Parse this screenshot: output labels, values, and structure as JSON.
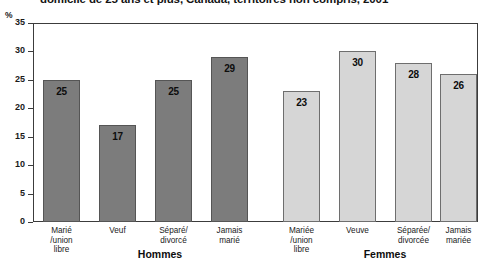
{
  "chart_data": {
    "type": "bar",
    "title": "domicile de 25 ans et plus, Canada, territoires non compris, 2001",
    "xlabel": "",
    "ylabel": "%",
    "ylim": [
      0,
      35
    ],
    "yticks": [
      "0",
      "5",
      "10",
      "15",
      "20",
      "25",
      "30",
      "35"
    ],
    "grid": false,
    "legend": "none",
    "groups": [
      {
        "name": "Hommes",
        "color": "#7c7c7c",
        "categories": [
          "Marié\n/union\nlibre",
          "Veuf",
          "Séparé/\ndivorcé",
          "Jamais\nmarié"
        ],
        "values": [
          25,
          17,
          25,
          29
        ]
      },
      {
        "name": "Femmes",
        "color": "#d6d6d6",
        "categories": [
          "Mariée\n/union\nlibre",
          "Veuve",
          "Séparée/\ndivorcée",
          "Jamais\nmariée"
        ],
        "values": [
          23,
          30,
          28,
          26
        ]
      }
    ],
    "categories": [
      "Marié\n/union\nlibre",
      "Veuf",
      "Séparé/\ndivorcé",
      "Jamais\nmarié",
      "Mariée\n/union\nlibre",
      "Veuve",
      "Séparée/\ndivorcée",
      "Jamais\nmariée"
    ],
    "values": [
      25,
      17,
      25,
      29,
      23,
      30,
      28,
      26
    ]
  },
  "axis": {
    "unit_label": "%"
  },
  "colors": {
    "hommes_bar": "#7c7c7c",
    "femmes_bar": "#d6d6d6",
    "frame": "#3c3c3c",
    "text": "#1a1a1a"
  }
}
